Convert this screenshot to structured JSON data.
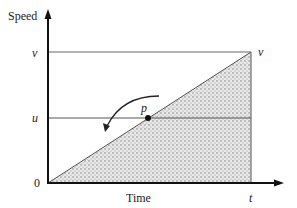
{
  "diagram": {
    "type": "speed-time graph",
    "y_axis_label": "Speed",
    "x_axis_label": "Time",
    "origin_label": "0",
    "y_ticks": [
      "v",
      "u"
    ],
    "x_ticks": [
      "t"
    ],
    "corner_label": "v",
    "point_label": "p",
    "shaded_region": "triangle under line from origin to (t, v)",
    "colors": {
      "axis": "#111111",
      "line": "#555555",
      "fill": "#bbbbbb"
    }
  }
}
